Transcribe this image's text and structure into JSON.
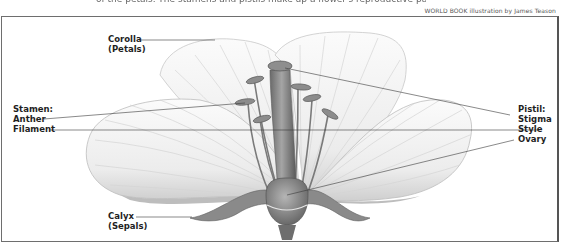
{
  "header": {
    "caption_fragment": "of the petals. The stamens and pistils make up a flower's reproductive parts.",
    "credit": "WORLD BOOK illustration by James Teason"
  },
  "diagram": {
    "labels": {
      "corolla": "Corolla",
      "corolla_sub": "(Petals)",
      "stamen": "Stamen:",
      "anther": "Anther",
      "filament": "Filament",
      "calyx": "Calyx",
      "calyx_sub": "(Sepals)",
      "pistil": "Pistil:",
      "stigma": "Stigma",
      "style": "Style",
      "ovary": "Ovary"
    },
    "colors": {
      "petal_fill": "#f2f2f2",
      "petal_shade": "#c9c9c9",
      "organ_fill": "#8c8c8c",
      "organ_dark": "#5e5e5e",
      "leader_line": "#3a3a3a"
    }
  }
}
